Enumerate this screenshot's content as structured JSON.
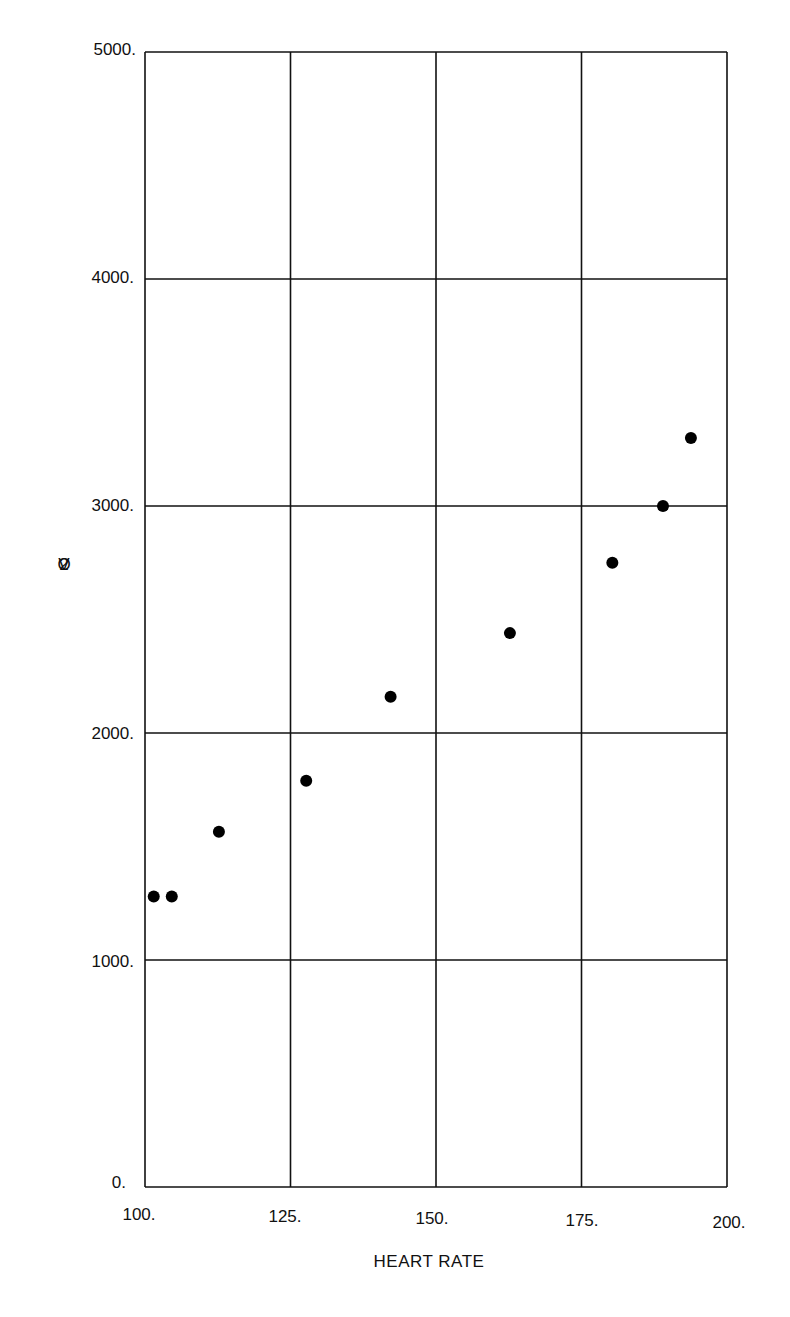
{
  "chart_data": {
    "type": "scatter",
    "title": "",
    "xlabel": "HEART RATE",
    "ylabel": "VO2",
    "xlim": [
      100,
      200
    ],
    "ylim": [
      0,
      5000
    ],
    "grid": true,
    "legend": null,
    "x_ticks": [
      "100.",
      "125.",
      "150.",
      "175.",
      "200."
    ],
    "y_ticks": [
      "0.",
      "1000.",
      "2000.",
      "3000.",
      "4000.",
      "5000."
    ],
    "series": [
      {
        "name": "VO2 vs Heart Rate",
        "x": [
          101.5,
          104.6,
          112.7,
          127.7,
          142.2,
          162.7,
          180.3,
          189.0,
          193.8
        ],
        "y": [
          1280,
          1280,
          1565,
          1790,
          2160,
          2440,
          2750,
          3000,
          3300
        ]
      }
    ]
  },
  "axes": {
    "xlabel": "HEART RATE",
    "ylabel_chars": [
      "V",
      "O",
      "2"
    ],
    "x_ticks": [
      {
        "label": "100.",
        "value": 100
      },
      {
        "label": "125.",
        "value": 125
      },
      {
        "label": "150.",
        "value": 150
      },
      {
        "label": "175.",
        "value": 175
      },
      {
        "label": "200.",
        "value": 200
      }
    ],
    "y_ticks": [
      {
        "label": "0.",
        "value": 0
      },
      {
        "label": "1000.",
        "value": 1000
      },
      {
        "label": "2000.",
        "value": 2000
      },
      {
        "label": "3000.",
        "value": 3000
      },
      {
        "label": "4000.",
        "value": 4000
      },
      {
        "label": "5000.",
        "value": 5000
      }
    ]
  },
  "colors": {
    "line": "#111111",
    "marker": "#000000",
    "background": "#ffffff"
  }
}
